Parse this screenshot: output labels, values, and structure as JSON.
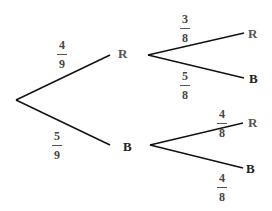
{
  "tree": {
    "stage1": {
      "red": {
        "label": "R",
        "prob": {
          "num": "4",
          "den": "9"
        }
      },
      "blue": {
        "label": "B",
        "prob": {
          "num": "5",
          "den": "9"
        }
      }
    },
    "stage2_after_red": {
      "red": {
        "label": "R",
        "prob": {
          "num": "3",
          "den": "8"
        }
      },
      "blue": {
        "label": "B",
        "prob": {
          "num": "5",
          "den": "8"
        }
      }
    },
    "stage2_after_blue": {
      "red": {
        "label": "R",
        "prob": {
          "num": "4",
          "den": "8"
        }
      },
      "blue": {
        "label": "B",
        "prob": {
          "num": "4",
          "den": "8"
        }
      }
    }
  },
  "colors": {
    "line": "#111111",
    "text": "#444444"
  }
}
